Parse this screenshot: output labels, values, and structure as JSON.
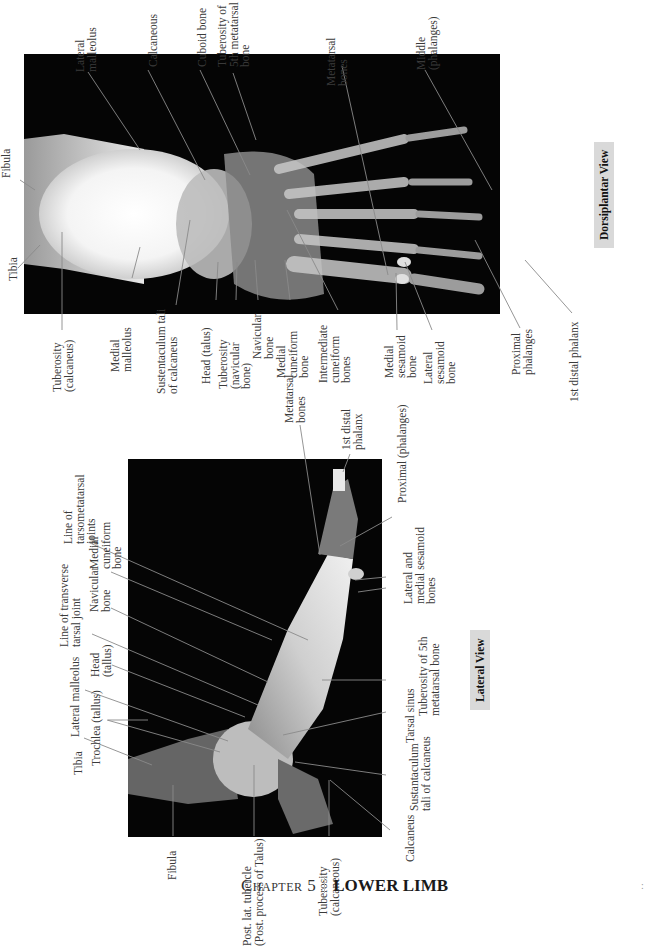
{
  "dorsiplantar": {
    "view_label": "Dorsiplantar View",
    "labels": {
      "fibula": "Fibula",
      "tibia": "Tibia",
      "lateral_malleolus": "Lateral\nmalleolus",
      "calcaneous": "Calcaneous",
      "cuboid_bone": "Cuboid bone",
      "tuberosity_5th_metatarsal": "Tuberosity of\n5th metatarsal\nbone",
      "metatarsal_bones": "Metatarsal\nbones",
      "middle_phalanges": "Middle\n(phalanges)",
      "tuberosity_calcaneus": "Tuberosity\n(calcaneus)",
      "medial_malleolus": "Medial\nmalleolus",
      "sustentaculum_tali": "Sustentaculum tali\nof calcaneus",
      "head_talus": "Head (talus)",
      "tuberosity_navicular": "Tuberosity\n(navicular\nbone)",
      "navicular_bone": "Navicular\nbone",
      "medial_cuneiform": "Medial\ncuneiform\nbone",
      "intermediate_cuneiform": "Intermediate\ncuneiform\nbones",
      "medial_sesamoid": "Medial\nsesamoid\nbone",
      "lateral_sesamoid": "Lateral\nsesamoid\nbone",
      "proximal_phalanges": "Proximal\nphalanges",
      "first_distal_phalanx": "1st distal phalanx"
    }
  },
  "lateral": {
    "view_label": "Lateral View",
    "labels": {
      "line_tarsometatarsal": "Line of\ntarsometatarsal\njoints",
      "medial_cuneiform": "Medial\ncuneiform\nbone",
      "navicular_bone": "Navicular\nbone",
      "line_transverse_tarsal": "Line of transverse\ntarsal joint",
      "head_tallus": "Head\n(tallus)",
      "lateral_malleolus": "Lateral malleolus",
      "trochlea_tallus": "Trochlea (tallus)",
      "tibia": "Tibia",
      "fibula": "Fibula",
      "post_lat_tubercle": "Post. lat. tubercle\n(Post. process of Talus)",
      "tuberosity_calcaneous": "Tuberosity\n(calcaneous)",
      "calcaneus": "Calcaneus",
      "sustantaculum": "Sustantaculum\ntali of calcaneus",
      "tarsal_sinus": "Tarsal sinus",
      "tuberosity_5th_metatarsal": "Tuberosity of 5th\nmetatarsal bone",
      "sesamoid_bones": "Lateral and\nmedial sesamoid\nbones",
      "proximal_phalanges": "Proximal (phalanges)",
      "first_distal_phalanx": "1st distal\nphalanx",
      "metatarsal_bones": "Metatarsal\nbones"
    }
  },
  "footer": {
    "chapter": "Chapter 5",
    "title": "LOWER LIMB"
  }
}
